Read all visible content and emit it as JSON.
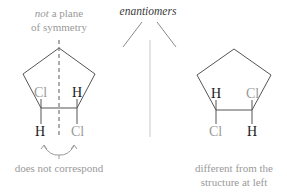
{
  "colors": {
    "bond": "#555555",
    "muted_text": "#9a9a9a",
    "dark_text": "#1a1a1a",
    "arrow": "#8a8a8a",
    "vertical_line": "#cfcfcf",
    "background": "#ffffff"
  },
  "header": {
    "label": "enantiomers"
  },
  "left_structure": {
    "caption_italic": "not",
    "caption_rest_line1": " a plane",
    "caption_line2": "of symmetry",
    "upper_left_atom": "Cl",
    "upper_right_atom": "H",
    "lower_left_atom": "H",
    "lower_right_atom": "Cl",
    "bottom_note": "does not correspond"
  },
  "right_structure": {
    "upper_left_atom": "H",
    "upper_right_atom": "Cl",
    "lower_left_atom": "Cl",
    "lower_right_atom": "H",
    "bottom_note_line1": "different from the",
    "bottom_note_line2": "structure at left"
  }
}
